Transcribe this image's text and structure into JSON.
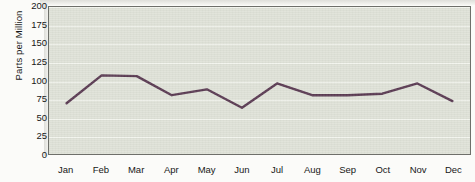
{
  "chart_data": {
    "type": "line",
    "title": "",
    "xlabel": "",
    "ylabel": "Parts per Million",
    "categories": [
      "Jan",
      "Feb",
      "Mar",
      "Apr",
      "May",
      "Jun",
      "Jul",
      "Aug",
      "Sep",
      "Oct",
      "Nov",
      "Dec"
    ],
    "values": [
      69,
      107,
      106,
      80,
      88,
      63,
      96,
      80,
      80,
      82,
      96,
      72
    ],
    "series": [
      {
        "name": "Parts per Million",
        "values": [
          69,
          107,
          106,
          80,
          88,
          63,
          96,
          80,
          80,
          82,
          96,
          72
        ]
      }
    ],
    "ylim": [
      0,
      200
    ],
    "yticks": [
      0,
      25,
      50,
      75,
      100,
      125,
      150,
      175,
      200
    ],
    "ytick_labels": [
      "0",
      "25",
      "50",
      "75",
      "100",
      "125",
      "150",
      "175",
      "200"
    ],
    "grid": true,
    "grid_axis": "y",
    "legend": false,
    "legend_position": "none",
    "line_color": "#5a3a52",
    "line_width": 2.4,
    "markers": false,
    "plot_background": "#dfe2d8",
    "gridline_color": "#f3f5ef",
    "axis_color": "#6e6f6a",
    "figure_background": "#fbfbf9"
  }
}
